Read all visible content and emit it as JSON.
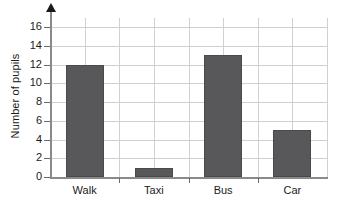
{
  "chart_data": {
    "type": "bar",
    "title": "",
    "xlabel": "",
    "ylabel": "Number of pupils",
    "categories": [
      "Walk",
      "Taxi",
      "Bus",
      "Car"
    ],
    "values": [
      12,
      1,
      13,
      5
    ],
    "ylim": [
      0,
      17
    ],
    "ytick_labels": [
      "0",
      "2",
      "4",
      "6",
      "8",
      "10",
      "12",
      "14",
      "16"
    ],
    "ytick_values": [
      0,
      2,
      4,
      6,
      8,
      10,
      12,
      14,
      16
    ],
    "grid": true,
    "legend": "none",
    "bar_color": "#58585a",
    "grid_color": "#d0d0d0",
    "axis_color": "#8a8a8a",
    "text_color": "#1a1a1a"
  }
}
